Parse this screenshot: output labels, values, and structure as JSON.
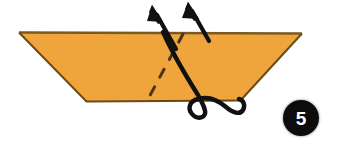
{
  "diagram": {
    "step_number": "5",
    "background_color": "#ffffff",
    "paper": {
      "name": "folded-paper-trapezoid",
      "fill_color": "#f0a53c",
      "edge_color": "#6b4a18",
      "shape": "trapezoid",
      "points": "19,32 302,33 240,101 87,102"
    },
    "fold_line": {
      "name": "valley-fold-dashed-line",
      "style": "dashed",
      "color": "#4a3318",
      "from": "183,34",
      "to": "147,101"
    },
    "arrows": [
      {
        "name": "fold-arrow-left",
        "color": "#111111",
        "tip": "152,5",
        "tail": "176,48",
        "direction": "up-left"
      },
      {
        "name": "fold-arrow-right",
        "color": "#111111",
        "tip": "188,2",
        "tail": "209,40",
        "direction": "up-left"
      }
    ],
    "curved_stroke": {
      "name": "fold-motion-curve-with-loop",
      "color": "#111111",
      "description": "thick solid curve crossing the paper, looping beneath the lower edge"
    }
  }
}
